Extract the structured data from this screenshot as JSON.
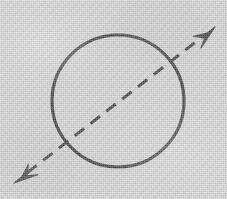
{
  "figure": {
    "title": "Circle with double-headed dashed diameter arrow",
    "canvas": {
      "width": 227,
      "height": 199,
      "background_color": "#cdcdcd",
      "ink_color": "#101010",
      "texture": "scanned-paper-noise"
    },
    "shapes": {
      "circle": {
        "label": "circle-outline",
        "center_x": 118,
        "center_y": 101,
        "radius": 66,
        "stroke_width": 3.2,
        "stroke_color": "#101010",
        "fill": "none"
      },
      "axis_arrow": {
        "label": "dashed-double-arrow",
        "start_x": 14,
        "start_y": 183,
        "end_x": 215,
        "end_y": 27,
        "stroke_width": 3.0,
        "stroke_color": "#101010",
        "dash_length": 12,
        "gap_length": 8,
        "arrowhead_start": "filled-barbed-triangle",
        "arrowhead_end": "filled-barbed-triangle",
        "arrowhead_length": 24,
        "arrowhead_half_width": 8
      }
    }
  }
}
